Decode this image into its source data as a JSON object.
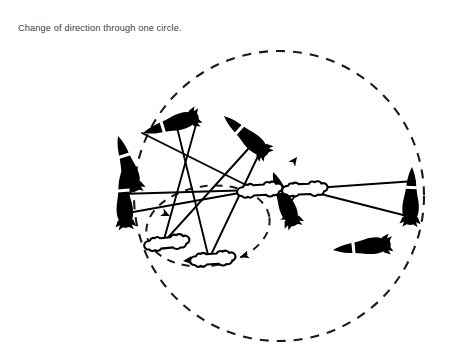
{
  "page": {
    "background_color": "#ffffff",
    "width": 460,
    "height": 348
  },
  "caption": {
    "text": "Change of direction through one circle.",
    "color": "#3c3c3c"
  },
  "figure": {
    "title": "Change of direction through one circle",
    "ink_color": "#000000",
    "dash_color": "#1a1a1a",
    "outer_circle": {
      "name": "large-dashed-circle",
      "cx": 279,
      "cy": 196,
      "r": 145,
      "style": "dashed"
    },
    "inner_circle": {
      "name": "inner-dashed-circle",
      "cx": 208,
      "cy": 226,
      "rx": 62,
      "ry": 40,
      "style": "dashed",
      "rotation": -8
    },
    "handlers": [
      {
        "name": "handler-center-left",
        "x": 256,
        "y": 190,
        "label": "center handler"
      },
      {
        "name": "handler-center-right",
        "x": 301,
        "y": 189,
        "label": "second handler"
      },
      {
        "name": "handler-lower-left",
        "x": 163,
        "y": 243,
        "label": "lower-left handler"
      },
      {
        "name": "handler-lower-mid",
        "x": 209,
        "y": 259,
        "label": "lower-middle handler"
      }
    ],
    "horses": [
      {
        "name": "horse-top-left",
        "x": 168,
        "y": 125,
        "angle": -15,
        "length": 54
      },
      {
        "name": "horse-top-right",
        "x": 237,
        "y": 133,
        "angle": 33,
        "length": 54
      },
      {
        "name": "horse-left-upper",
        "x": 130,
        "y": 150,
        "angle": 64,
        "length": 50
      },
      {
        "name": "horse-left-lower",
        "x": 125,
        "y": 196,
        "angle": 82,
        "length": 56
      },
      {
        "name": "horse-mid-right",
        "x": 281,
        "y": 196,
        "angle": 62,
        "length": 52
      },
      {
        "name": "horse-bottom-right",
        "x": 356,
        "y": 250,
        "angle": 5,
        "length": 56
      },
      {
        "name": "horse-far-right",
        "x": 417,
        "y": 196,
        "angle": 92,
        "length": 58
      }
    ],
    "lunge_lines": [
      {
        "name": "lunge-line-1",
        "from": [
          256,
          190
        ],
        "to": [
          142,
          132
        ]
      },
      {
        "name": "lunge-line-2",
        "from": [
          256,
          190
        ],
        "to": [
          122,
          196
        ]
      },
      {
        "name": "lunge-line-3",
        "from": [
          256,
          190
        ],
        "to": [
          124,
          212
        ]
      },
      {
        "name": "lunge-line-4",
        "from": [
          163,
          243
        ],
        "to": [
          196,
          122
        ]
      },
      {
        "name": "lunge-line-5",
        "from": [
          163,
          243
        ],
        "to": [
          247,
          146
        ]
      },
      {
        "name": "lunge-line-6",
        "from": [
          209,
          259
        ],
        "to": [
          175,
          119
        ]
      },
      {
        "name": "lunge-line-7",
        "from": [
          209,
          259
        ],
        "to": [
          258,
          153
        ]
      },
      {
        "name": "lunge-line-8",
        "from": [
          301,
          189
        ],
        "to": [
          414,
          182
        ]
      },
      {
        "name": "lunge-line-9",
        "from": [
          301,
          189
        ],
        "to": [
          410,
          216
        ]
      },
      {
        "name": "lunge-line-10",
        "from": [
          301,
          189
        ],
        "to": [
          288,
          205
        ]
      }
    ],
    "arrows": [
      {
        "name": "direction-arrow-right-up",
        "x": 299,
        "y": 160,
        "angle": -52
      },
      {
        "name": "direction-arrow-inner-right",
        "x": 288,
        "y": 218,
        "angle": 18
      },
      {
        "name": "direction-arrow-inner-lower",
        "x": 245,
        "y": 258,
        "angle": 162
      },
      {
        "name": "direction-arrow-inner-left",
        "x": 186,
        "y": 261,
        "angle": 173
      },
      {
        "name": "direction-arrow-mid-left",
        "x": 167,
        "y": 215,
        "angle": 22
      }
    ]
  }
}
